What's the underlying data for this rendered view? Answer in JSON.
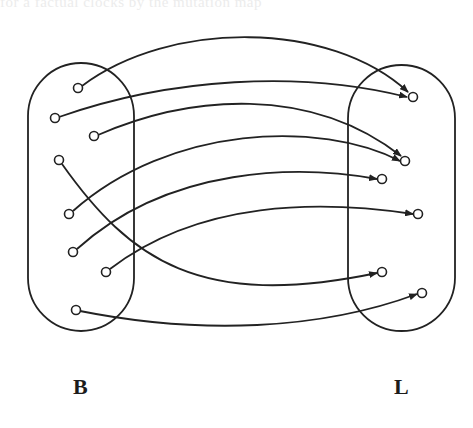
{
  "figure": {
    "bleed_through_text": "for a factual clocks by the mutation map",
    "stroke_color": "#222222",
    "background": "#ffffff",
    "sets": [
      {
        "id": "B",
        "label": "B",
        "shape": "rounded-rect",
        "bounds": {
          "x": 28,
          "y": 63,
          "width": 106,
          "height": 268
        },
        "label_position": {
          "x": 73,
          "y": 376
        },
        "nodes": [
          {
            "id": "b1",
            "x": 78,
            "y": 88
          },
          {
            "id": "b2",
            "x": 55,
            "y": 118
          },
          {
            "id": "b3",
            "x": 94,
            "y": 136
          },
          {
            "id": "b4",
            "x": 59,
            "y": 160
          },
          {
            "id": "b5",
            "x": 69,
            "y": 214
          },
          {
            "id": "b6",
            "x": 73,
            "y": 252
          },
          {
            "id": "b7",
            "x": 106,
            "y": 272
          },
          {
            "id": "b8",
            "x": 76,
            "y": 310
          }
        ]
      },
      {
        "id": "L",
        "label": "L",
        "shape": "rounded-rect",
        "bounds": {
          "x": 348,
          "y": 65,
          "width": 107,
          "height": 266
        },
        "label_position": {
          "x": 394,
          "y": 376
        },
        "nodes": [
          {
            "id": "l1",
            "x": 413,
            "y": 97
          },
          {
            "id": "l2",
            "x": 405,
            "y": 161
          },
          {
            "id": "l3",
            "x": 382,
            "y": 179
          },
          {
            "id": "l4",
            "x": 418,
            "y": 214
          },
          {
            "id": "l5",
            "x": 382,
            "y": 272
          },
          {
            "id": "l6",
            "x": 422,
            "y": 293
          }
        ]
      }
    ],
    "edges": [
      {
        "from": "b1",
        "to": "l1",
        "path": "M 82 86 C 170 20, 330 20, 408 92"
      },
      {
        "from": "b2",
        "to": "l1",
        "path": "M 59 117 C 170 78, 300 70, 407 97"
      },
      {
        "from": "b3",
        "to": "l2",
        "path": "M 98 135 C 190 95, 310 85, 401 156"
      },
      {
        "from": "b5",
        "to": "l2",
        "path": "M 73 211 C 170 125, 320 120, 400 161"
      },
      {
        "from": "b6",
        "to": "l3",
        "path": "M 77 249 C 170 165, 300 165, 377 179"
      },
      {
        "from": "b7",
        "to": "l4",
        "path": "M 110 269 C 200 200, 320 200, 413 214"
      },
      {
        "from": "b4",
        "to": "l5",
        "path": "M 62 164 C 130 260, 200 310, 377 273"
      },
      {
        "from": "b8",
        "to": "l6",
        "path": "M 80 311 C 200 335, 320 330, 417 294"
      }
    ]
  }
}
